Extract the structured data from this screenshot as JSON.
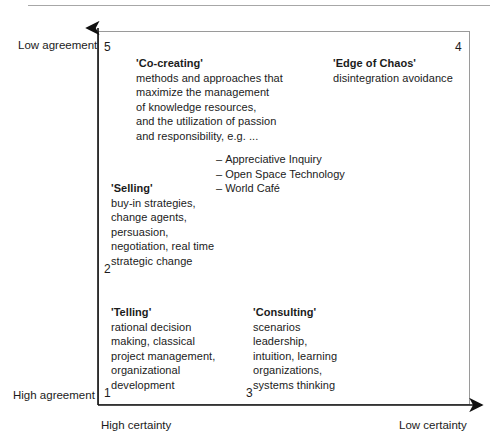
{
  "diagram": {
    "axes": {
      "y_top_label": "Low agreement",
      "y_bottom_label": "High agreement",
      "x_left_label": "High certainty",
      "x_right_label": "Low certainty"
    },
    "colors": {
      "light_gray": "#e2e2e2",
      "mid_gray": "#dcdcdc",
      "dark_gray": "#a6a6a6",
      "frame_line": "#9a9a9a",
      "text": "#1b1b1b"
    },
    "quadrants": [
      {
        "number": "5",
        "name": "co-creating",
        "title": "'Co-creating'",
        "lines": [
          "methods and approaches that",
          "maximize the management",
          "of knowledge resources,",
          "and the utilization of passion",
          "and responsibility, e.g. ..."
        ],
        "bullets": [
          "Appreciative Inquiry",
          "Open Space Technology",
          "World Café"
        ],
        "fill": "none"
      },
      {
        "number": "4",
        "name": "edge-of-chaos",
        "title": "'Edge of Chaos'",
        "lines": [
          "disintegration avoidance"
        ],
        "fill": "#e2e2e2"
      },
      {
        "number": "2",
        "name": "selling",
        "title": "'Selling'",
        "lines": [
          "buy-in strategies,",
          "change agents,",
          "persuasion,",
          "negotiation, real time",
          "strategic change"
        ],
        "fill": "#e2e2e2"
      },
      {
        "number": "1",
        "name": "telling",
        "title": "'Telling'",
        "lines": [
          "rational decision",
          "making, classical",
          "project management,",
          "organizational",
          "development"
        ],
        "fill": "#dcdcdc"
      },
      {
        "number": "3",
        "name": "consulting",
        "title": "'Consulting'",
        "lines": [
          "scenarios",
          "leadership,",
          "intuition, learning",
          "organizations,",
          "systems thinking"
        ],
        "fill": "#a6a6a6"
      }
    ],
    "bullet_marker": "–"
  }
}
